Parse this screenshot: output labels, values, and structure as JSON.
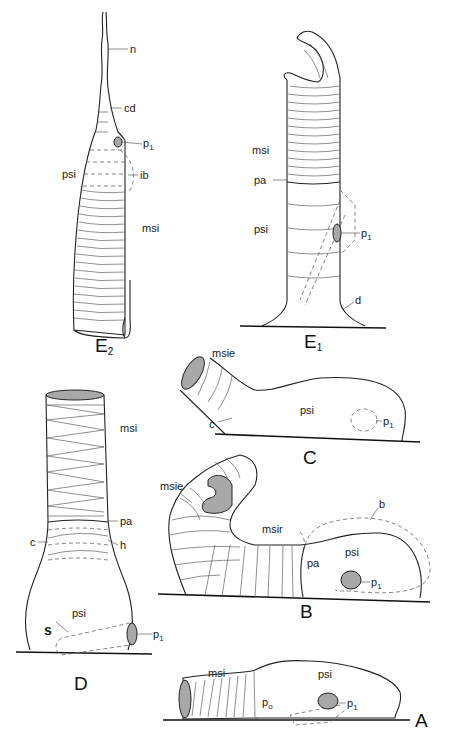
{
  "figure": {
    "panels": [
      {
        "id": "E2",
        "label": "E",
        "sub": "2",
        "annotations": {
          "n": "n",
          "cd": "cd",
          "p1": "p",
          "p1_sub": "1",
          "psi": "psi",
          "ib": "ib",
          "msi": "msi"
        }
      },
      {
        "id": "E1",
        "label": "E",
        "sub": "1",
        "annotations": {
          "msi": "msi",
          "pa": "pa",
          "psi": "psi",
          "p1": "p",
          "p1_sub": "1",
          "d": "d"
        }
      },
      {
        "id": "C",
        "label": "C",
        "annotations": {
          "msie": "msie",
          "psi": "psi",
          "c": "c",
          "p1": "p",
          "p1_sub": "1"
        }
      },
      {
        "id": "D",
        "label": "D",
        "annotations": {
          "msi": "msi",
          "pa": "pa",
          "c": "c",
          "h": "h",
          "psi": "psi",
          "s": "s",
          "p1": "p",
          "p1_sub": "1"
        }
      },
      {
        "id": "B",
        "label": "B",
        "annotations": {
          "msie": "msie",
          "msir": "msir",
          "b": "b",
          "pa": "pa",
          "psi": "psi",
          "p1": "p",
          "p1_sub": "1"
        }
      },
      {
        "id": "A",
        "label": "A",
        "annotations": {
          "msi": "msi",
          "psi": "psi",
          "p0": "p",
          "p0_sub": "o",
          "p1": "p",
          "p1_sub": "1"
        }
      }
    ],
    "colors": {
      "line": "#222222",
      "fill_gray": "#a8a8a8",
      "background": "#ffffff"
    }
  }
}
